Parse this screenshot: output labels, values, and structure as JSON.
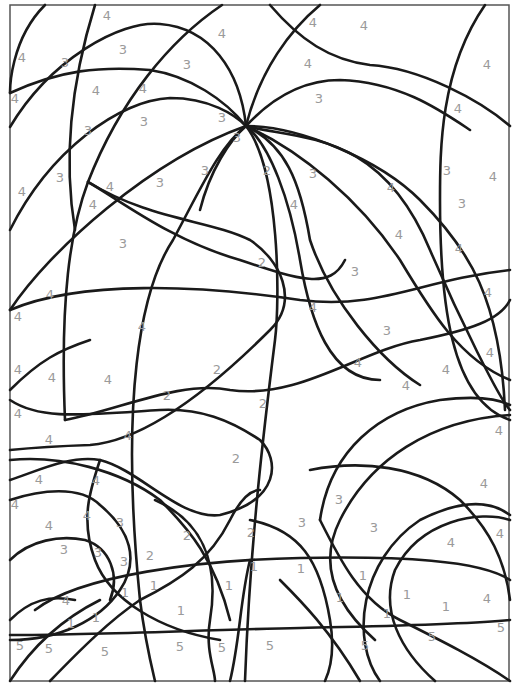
{
  "region_numbers": [
    {
      "n": "4",
      "x": 107,
      "y": 15
    },
    {
      "n": "4",
      "x": 22,
      "y": 57
    },
    {
      "n": "3",
      "x": 65,
      "y": 62
    },
    {
      "n": "3",
      "x": 123,
      "y": 49
    },
    {
      "n": "3",
      "x": 187,
      "y": 64
    },
    {
      "n": "4",
      "x": 222,
      "y": 33
    },
    {
      "n": "4",
      "x": 15,
      "y": 98
    },
    {
      "n": "4",
      "x": 96,
      "y": 90
    },
    {
      "n": "4",
      "x": 143,
      "y": 88
    },
    {
      "n": "3",
      "x": 88,
      "y": 130
    },
    {
      "n": "3",
      "x": 144,
      "y": 121
    },
    {
      "n": "3",
      "x": 222,
      "y": 117
    },
    {
      "n": "3",
      "x": 237,
      "y": 137
    },
    {
      "n": "4",
      "x": 313,
      "y": 22
    },
    {
      "n": "4",
      "x": 364,
      "y": 25
    },
    {
      "n": "4",
      "x": 308,
      "y": 63
    },
    {
      "n": "4",
      "x": 487,
      "y": 64
    },
    {
      "n": "3",
      "x": 319,
      "y": 98
    },
    {
      "n": "4",
      "x": 458,
      "y": 108
    },
    {
      "n": "4",
      "x": 22,
      "y": 191
    },
    {
      "n": "3",
      "x": 60,
      "y": 177
    },
    {
      "n": "4",
      "x": 110,
      "y": 186
    },
    {
      "n": "4",
      "x": 93,
      "y": 204
    },
    {
      "n": "3",
      "x": 160,
      "y": 182
    },
    {
      "n": "3",
      "x": 205,
      "y": 170
    },
    {
      "n": "2",
      "x": 267,
      "y": 170
    },
    {
      "n": "3",
      "x": 313,
      "y": 173
    },
    {
      "n": "4",
      "x": 391,
      "y": 187
    },
    {
      "n": "3",
      "x": 447,
      "y": 170
    },
    {
      "n": "4",
      "x": 493,
      "y": 176
    },
    {
      "n": "4",
      "x": 294,
      "y": 204
    },
    {
      "n": "3",
      "x": 462,
      "y": 203
    },
    {
      "n": "3",
      "x": 123,
      "y": 243
    },
    {
      "n": "2",
      "x": 262,
      "y": 262
    },
    {
      "n": "4",
      "x": 399,
      "y": 234
    },
    {
      "n": "4",
      "x": 459,
      "y": 248
    },
    {
      "n": "3",
      "x": 355,
      "y": 271
    },
    {
      "n": "4",
      "x": 488,
      "y": 292
    },
    {
      "n": "4",
      "x": 50,
      "y": 294
    },
    {
      "n": "4",
      "x": 18,
      "y": 316
    },
    {
      "n": "4",
      "x": 313,
      "y": 307
    },
    {
      "n": "4",
      "x": 142,
      "y": 326
    },
    {
      "n": "3",
      "x": 387,
      "y": 330
    },
    {
      "n": "4",
      "x": 490,
      "y": 352
    },
    {
      "n": "4",
      "x": 18,
      "y": 369
    },
    {
      "n": "4",
      "x": 52,
      "y": 377
    },
    {
      "n": "4",
      "x": 108,
      "y": 379
    },
    {
      "n": "2",
      "x": 217,
      "y": 369
    },
    {
      "n": "4",
      "x": 358,
      "y": 362
    },
    {
      "n": "2",
      "x": 167,
      "y": 395
    },
    {
      "n": "4",
      "x": 406,
      "y": 385
    },
    {
      "n": "4",
      "x": 446,
      "y": 369
    },
    {
      "n": "4",
      "x": 18,
      "y": 413
    },
    {
      "n": "2",
      "x": 263,
      "y": 403
    },
    {
      "n": "4",
      "x": 49,
      "y": 439
    },
    {
      "n": "4",
      "x": 128,
      "y": 435
    },
    {
      "n": "4",
      "x": 499,
      "y": 430
    },
    {
      "n": "2",
      "x": 236,
      "y": 458
    },
    {
      "n": "4",
      "x": 39,
      "y": 479
    },
    {
      "n": "4",
      "x": 96,
      "y": 480
    },
    {
      "n": "4",
      "x": 484,
      "y": 483
    },
    {
      "n": "4",
      "x": 15,
      "y": 504
    },
    {
      "n": "3",
      "x": 339,
      "y": 499
    },
    {
      "n": "4",
      "x": 49,
      "y": 525
    },
    {
      "n": "4",
      "x": 87,
      "y": 515
    },
    {
      "n": "3",
      "x": 120,
      "y": 522
    },
    {
      "n": "2",
      "x": 187,
      "y": 535
    },
    {
      "n": "2",
      "x": 251,
      "y": 532
    },
    {
      "n": "3",
      "x": 302,
      "y": 522
    },
    {
      "n": "3",
      "x": 374,
      "y": 527
    },
    {
      "n": "4",
      "x": 451,
      "y": 542
    },
    {
      "n": "4",
      "x": 500,
      "y": 533
    },
    {
      "n": "3",
      "x": 64,
      "y": 549
    },
    {
      "n": "3",
      "x": 98,
      "y": 552
    },
    {
      "n": "3",
      "x": 124,
      "y": 561
    },
    {
      "n": "2",
      "x": 150,
      "y": 555
    },
    {
      "n": "1",
      "x": 254,
      "y": 566
    },
    {
      "n": "1",
      "x": 301,
      "y": 568
    },
    {
      "n": "1",
      "x": 363,
      "y": 575
    },
    {
      "n": "4",
      "x": 66,
      "y": 600
    },
    {
      "n": "1",
      "x": 125,
      "y": 592
    },
    {
      "n": "1",
      "x": 154,
      "y": 585
    },
    {
      "n": "1",
      "x": 229,
      "y": 585
    },
    {
      "n": "1",
      "x": 181,
      "y": 610
    },
    {
      "n": "1",
      "x": 340,
      "y": 597
    },
    {
      "n": "1",
      "x": 407,
      "y": 594
    },
    {
      "n": "4",
      "x": 487,
      "y": 598
    },
    {
      "n": "1",
      "x": 71,
      "y": 623
    },
    {
      "n": "1",
      "x": 96,
      "y": 617
    },
    {
      "n": "1",
      "x": 387,
      "y": 613
    },
    {
      "n": "1",
      "x": 446,
      "y": 606
    },
    {
      "n": "5",
      "x": 20,
      "y": 645
    },
    {
      "n": "5",
      "x": 49,
      "y": 648
    },
    {
      "n": "5",
      "x": 105,
      "y": 651
    },
    {
      "n": "5",
      "x": 180,
      "y": 646
    },
    {
      "n": "5",
      "x": 222,
      "y": 647
    },
    {
      "n": "5",
      "x": 270,
      "y": 645
    },
    {
      "n": "5",
      "x": 365,
      "y": 645
    },
    {
      "n": "5",
      "x": 432,
      "y": 636
    },
    {
      "n": "5",
      "x": 501,
      "y": 627
    }
  ]
}
